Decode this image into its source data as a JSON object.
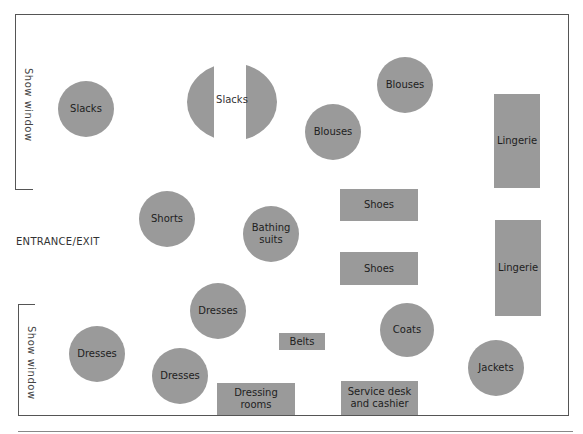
{
  "floor_plan": {
    "labels": {
      "show_window_top": "Show window",
      "show_window_bottom": "Show window",
      "entrance": "ENTRANCE/EXIT"
    },
    "colors": {
      "fixture": "#9a9a9a",
      "wall": "#555555",
      "background": "#ffffff"
    },
    "fixtures": [
      {
        "id": "slacks-1",
        "label": "Slacks",
        "shape": "circle",
        "cx": 86,
        "cy": 109,
        "r": 28
      },
      {
        "id": "slacks-2",
        "label": "Slacks",
        "shape": "split-circle",
        "cx": 231,
        "cy": 102,
        "r": 45
      },
      {
        "id": "blouses-1",
        "label": "Blouses",
        "shape": "circle",
        "cx": 405,
        "cy": 85,
        "r": 28
      },
      {
        "id": "blouses-2",
        "label": "Blouses",
        "shape": "circle",
        "cx": 333,
        "cy": 132,
        "r": 28
      },
      {
        "id": "lingerie-1",
        "label": "Lingerie",
        "shape": "rect",
        "x": 494,
        "y": 94,
        "w": 46,
        "h": 94
      },
      {
        "id": "shorts",
        "label": "Shorts",
        "shape": "circle",
        "cx": 167,
        "cy": 219,
        "r": 28
      },
      {
        "id": "bathing-suits",
        "label": "Bathing\nsuits",
        "shape": "circle",
        "cx": 271,
        "cy": 234,
        "r": 28
      },
      {
        "id": "shoes-1",
        "label": "Shoes",
        "shape": "rect",
        "x": 340,
        "y": 189,
        "w": 78,
        "h": 32
      },
      {
        "id": "shoes-2",
        "label": "Shoes",
        "shape": "rect",
        "x": 340,
        "y": 252,
        "w": 78,
        "h": 33
      },
      {
        "id": "lingerie-2",
        "label": "Lingerie",
        "shape": "rect",
        "x": 495,
        "y": 220,
        "w": 46,
        "h": 96
      },
      {
        "id": "dresses-1",
        "label": "Dresses",
        "shape": "circle",
        "cx": 218,
        "cy": 311,
        "r": 28
      },
      {
        "id": "dresses-2",
        "label": "Dresses",
        "shape": "circle",
        "cx": 97,
        "cy": 354,
        "r": 28
      },
      {
        "id": "dresses-3",
        "label": "Dresses",
        "shape": "circle",
        "cx": 180,
        "cy": 376,
        "r": 28
      },
      {
        "id": "belts",
        "label": "Belts",
        "shape": "rect",
        "x": 279,
        "y": 333,
        "w": 46,
        "h": 17
      },
      {
        "id": "coats",
        "label": "Coats",
        "shape": "circle",
        "cx": 407,
        "cy": 330,
        "r": 27
      },
      {
        "id": "jackets",
        "label": "Jackets",
        "shape": "circle",
        "cx": 496,
        "cy": 368,
        "r": 28
      },
      {
        "id": "dressing-rooms",
        "label": "Dressing\nrooms",
        "shape": "rect",
        "x": 217,
        "y": 383,
        "w": 78,
        "h": 32
      },
      {
        "id": "service-desk",
        "label": "Service desk\nand cashier",
        "shape": "rect",
        "x": 341,
        "y": 381,
        "w": 77,
        "h": 34
      }
    ],
    "split_slacks_label": "Slacks"
  }
}
